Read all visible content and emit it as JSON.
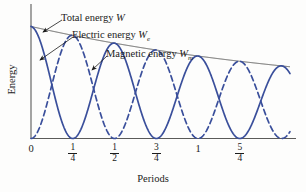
{
  "chart_data": {
    "type": "line",
    "title": "",
    "xlabel": "Periods",
    "ylabel": "Energy",
    "xlim": [
      0,
      1.55
    ],
    "ylim": [
      0,
      1.0
    ],
    "grid": false,
    "legend_position": "inline-callouts",
    "damping_tau_periods": 1.9,
    "envelope_floor": 0.33,
    "x_ticks": [
      {
        "value": 0,
        "label": "0",
        "num": "",
        "den": ""
      },
      {
        "value": 0.25,
        "label": "1/4",
        "num": "1",
        "den": "4"
      },
      {
        "value": 0.5,
        "label": "1/2",
        "num": "1",
        "den": "2"
      },
      {
        "value": 0.75,
        "label": "3/4",
        "num": "3",
        "den": "4"
      },
      {
        "value": 1.0,
        "label": "1",
        "num": "",
        "den": ""
      },
      {
        "value": 1.25,
        "label": "5/4",
        "num": "5",
        "den": "4"
      }
    ],
    "series": [
      {
        "name": "Total energy W",
        "label_text": "Total energy",
        "symbol": "W",
        "subscript": "",
        "style": "solid-thin",
        "color": "#4a4a48",
        "description": "Exponentially decaying envelope of total energy",
        "x": [
          0,
          0.125,
          0.25,
          0.375,
          0.5,
          0.625,
          0.75,
          0.875,
          1.0,
          1.125,
          1.25,
          1.375,
          1.5
        ],
        "values": [
          0.93,
          0.88,
          0.83,
          0.78,
          0.74,
          0.7,
          0.66,
          0.62,
          0.58,
          0.55,
          0.52,
          0.5,
          0.48
        ]
      },
      {
        "name": "Electric energy We",
        "label_text": "Electric energy",
        "symbol": "W",
        "subscript": "e",
        "style": "solid",
        "color": "#3a4f9b",
        "description": "Damped cosine-squared, maxima at 0, 1/2, 1, ... zeros at 1/4, 3/4, 5/4",
        "x": [
          0,
          0.125,
          0.25,
          0.375,
          0.5,
          0.625,
          0.75,
          0.875,
          1.0,
          1.125,
          1.25,
          1.375,
          1.5
        ],
        "values": [
          0.93,
          0.44,
          0.0,
          0.39,
          0.74,
          0.35,
          0.0,
          0.31,
          0.58,
          0.27,
          0.0,
          0.25,
          0.48
        ]
      },
      {
        "name": "Magnetic energy Wm",
        "label_text": "Magnetic energy",
        "symbol": "W",
        "subscript": "m",
        "style": "dashed",
        "color": "#3a4f9b",
        "description": "Damped sine-squared, zeros at 0, 1/2, 1, ... maxima at 1/4, 3/4, 5/4",
        "x": [
          0,
          0.125,
          0.25,
          0.375,
          0.5,
          0.625,
          0.75,
          0.875,
          1.0,
          1.125,
          1.25,
          1.375,
          1.5
        ],
        "values": [
          0.0,
          0.44,
          0.83,
          0.39,
          0.0,
          0.35,
          0.66,
          0.31,
          0.0,
          0.27,
          0.52,
          0.25,
          0.0
        ]
      }
    ],
    "annotations": [
      {
        "name": "total-energy-callout",
        "text": "Total energy",
        "symbol": "W",
        "sub": ""
      },
      {
        "name": "electric-energy-callout",
        "text": "Electric energy",
        "symbol": "W",
        "sub": "e"
      },
      {
        "name": "magnetic-energy-callout",
        "text": "Magnetic energy",
        "symbol": "W",
        "sub": "m"
      }
    ],
    "colors": {
      "curve_blue": "#3a4f9b",
      "envelope_gray": "#4a4a48",
      "axis": "#5a5a58",
      "text": "#1b1b1b",
      "background": "#fdfdfc"
    }
  }
}
